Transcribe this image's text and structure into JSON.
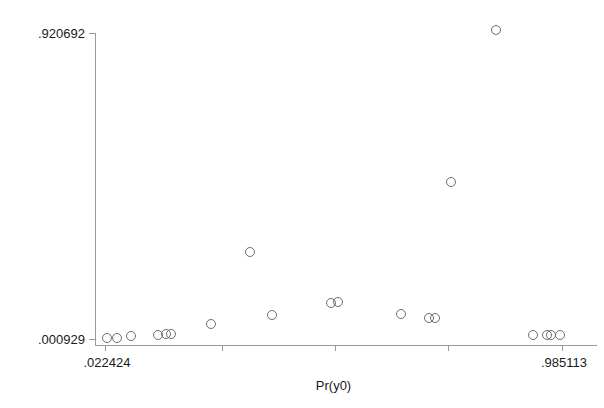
{
  "chart_data": {
    "type": "scatter",
    "title": "",
    "xlabel": "Pr(y0)",
    "ylabel": "",
    "xlim": [
      0.022424,
      0.985113
    ],
    "ylim": [
      0.000929,
      0.920692
    ],
    "grid": false,
    "legend": null,
    "x_tick_labels": [
      ".022424",
      ".985113"
    ],
    "y_tick_labels": [
      ".000929",
      ".920692"
    ],
    "x_ticks_values": [
      0.022424,
      0.263096,
      0.503769,
      0.744441,
      0.985113
    ],
    "y_ticks_values": [
      0.000929,
      0.920692
    ],
    "marker": "open-circle",
    "marker_color": "#6e6e6e",
    "axis_color": "#9a9a9a",
    "points": [
      {
        "x": 0.0266,
        "y": 0.0093
      },
      {
        "x": 0.0688,
        "y": 0.0093
      },
      {
        "x": 0.1279,
        "y": 0.0225
      },
      {
        "x": 0.2419,
        "y": 0.0225
      },
      {
        "x": 0.2757,
        "y": 0.0225
      },
      {
        "x": 0.2926,
        "y": 0.0225
      },
      {
        "x": 0.4657,
        "y": 0.0584
      },
      {
        "x": 0.6304,
        "y": 0.2582
      },
      {
        "x": 0.7233,
        "y": 0.1024
      },
      {
        "x": 0.9556,
        "y": 0.1179
      },
      {
        "x": 0.9851,
        "y": 0.1179
      },
      {
        "x": 1.3107,
        "y": 0.1179
      },
      {
        "x": 1.632,
        "y": 0.0851
      },
      {
        "x": 1.7503,
        "y": 0.0717
      },
      {
        "x": 1.8193,
        "y": 0.0717
      },
      {
        "x": 1.8784,
        "y": 0.713
      },
      {
        "x": 2.0684,
        "y": 0.9207
      },
      {
        "x": 2.1205,
        "y": 0.0253
      },
      {
        "x": 2.1797,
        "y": 0.0253
      },
      {
        "x": 2.2924,
        "y": 0.0253
      }
    ],
    "points_px": [
      {
        "cx": 107,
        "cy": 338
      },
      {
        "cx": 117,
        "cy": 338
      },
      {
        "cx": 131,
        "cy": 336
      },
      {
        "cx": 158,
        "cy": 335
      },
      {
        "cx": 166,
        "cy": 334
      },
      {
        "cx": 171,
        "cy": 334
      },
      {
        "cx": 211,
        "cy": 324
      },
      {
        "cx": 250,
        "cy": 252
      },
      {
        "cx": 272,
        "cy": 315
      },
      {
        "cx": 331,
        "cy": 303
      },
      {
        "cx": 338,
        "cy": 302
      },
      {
        "cx": 401,
        "cy": 314
      },
      {
        "cx": 429,
        "cy": 318
      },
      {
        "cx": 435,
        "cy": 318
      },
      {
        "cx": 451,
        "cy": 182
      },
      {
        "cx": 496,
        "cy": 30
      },
      {
        "cx": 533,
        "cy": 335
      },
      {
        "cx": 547,
        "cy": 335
      },
      {
        "cx": 551,
        "cy": 335
      },
      {
        "cx": 560,
        "cy": 335
      }
    ]
  },
  "axes_px": {
    "x_axis_y": 345,
    "y_axis_x": 95,
    "x_axis_left": 95,
    "x_axis_right": 597,
    "y_axis_top": 33,
    "y_axis_bottom": 345,
    "y_tick_top_y": 33,
    "y_tick_bottom_y": 339,
    "x_tick_px": [
      105,
      222,
      335,
      448,
      562
    ],
    "tick_len": 6,
    "marker_r": 4.5
  },
  "labels": {
    "y_top": ".920692",
    "y_bottom": ".000929",
    "x_left": ".022424",
    "x_right": ".985113",
    "x_title": "Pr(y0)"
  }
}
